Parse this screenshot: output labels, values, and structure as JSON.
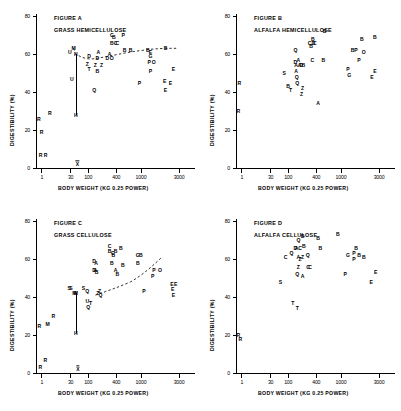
{
  "figure": {
    "layout": "2x2 grid of scatter plots",
    "axis": {
      "ylabel": "DIGESTIBILITY (%)",
      "xlabel": "BODY WEIGHT  (KG 0.25 POWER)",
      "yticks": [
        "0",
        "20",
        "40",
        "60",
        "80"
      ],
      "ytick_values": [
        0,
        20,
        40,
        60,
        80
      ],
      "xticks": [
        "1",
        "30",
        "100",
        "400",
        "1000",
        "3000"
      ],
      "xtick_values": [
        1,
        30,
        100,
        400,
        1000,
        3000
      ],
      "ylim": [
        0,
        80
      ],
      "grid": false,
      "legend": "none"
    }
  },
  "chart_data": [
    {
      "type": "scatter",
      "id": "A",
      "title": "FIGURE A",
      "subtitle": "GRASS HEMICELLULOSE",
      "xlabel": "BODY WEIGHT  (KG 0.25 POWER)",
      "ylabel": "DIGESTIBILITY (%)",
      "ylim": [
        0,
        80
      ],
      "xticks": [
        1,
        30,
        100,
        400,
        1000,
        3000
      ],
      "yticks": [
        0,
        20,
        40,
        60,
        80
      ],
      "grid": false,
      "point_labels": "single-letter species codes",
      "points": [
        {
          "label": "R",
          "x": 0.55,
          "y": 26
        },
        {
          "label": "R",
          "x": 0.95,
          "y": 19
        },
        {
          "label": "R",
          "x": 0.8,
          "y": 7
        },
        {
          "label": "R",
          "x": 1.9,
          "y": 7
        },
        {
          "label": "R",
          "x": 3.6,
          "y": 29
        },
        {
          "label": "U",
          "x": 28,
          "y": 61
        },
        {
          "label": "U",
          "x": 33,
          "y": 47
        },
        {
          "label": "M",
          "x": 38,
          "y": 63
        },
        {
          "label": "H",
          "x": 45,
          "y": 60
        },
        {
          "label": "H",
          "x": 45,
          "y": 28
        },
        {
          "label": "D",
          "x": 105,
          "y": 59
        },
        {
          "label": "Z",
          "x": 95,
          "y": 55
        },
        {
          "label": "T",
          "x": 105,
          "y": 52
        },
        {
          "label": "Q",
          "x": 140,
          "y": 41
        },
        {
          "label": "A",
          "x": 175,
          "y": 61
        },
        {
          "label": "D",
          "x": 165,
          "y": 58
        },
        {
          "label": "Z",
          "x": 150,
          "y": 54
        },
        {
          "label": "B",
          "x": 165,
          "y": 51
        },
        {
          "label": "Z",
          "x": 205,
          "y": 54
        },
        {
          "label": "C",
          "x": 330,
          "y": 70
        },
        {
          "label": "B",
          "x": 360,
          "y": 69
        },
        {
          "label": "B",
          "x": 330,
          "y": 66
        },
        {
          "label": "C",
          "x": 390,
          "y": 66
        },
        {
          "label": "C",
          "x": 420,
          "y": 66
        },
        {
          "label": "P",
          "x": 530,
          "y": 70
        },
        {
          "label": "A",
          "x": 300,
          "y": 60
        },
        {
          "label": "D",
          "x": 270,
          "y": 58
        },
        {
          "label": "O",
          "x": 330,
          "y": 58
        },
        {
          "label": "B",
          "x": 560,
          "y": 62
        },
        {
          "label": "B",
          "x": 700,
          "y": 62
        },
        {
          "label": "B",
          "x": 1250,
          "y": 62
        },
        {
          "label": "E",
          "x": 1350,
          "y": 61
        },
        {
          "label": "G",
          "x": 1350,
          "y": 59
        },
        {
          "label": "B",
          "x": 2100,
          "y": 63
        },
        {
          "label": "P",
          "x": 1300,
          "y": 56
        },
        {
          "label": "O",
          "x": 1500,
          "y": 56
        },
        {
          "label": "P",
          "x": 1350,
          "y": 51
        },
        {
          "label": "P",
          "x": 950,
          "y": 45
        },
        {
          "label": "E",
          "x": 2600,
          "y": 52
        },
        {
          "label": "E",
          "x": 2050,
          "y": 46
        },
        {
          "label": "E",
          "x": 2400,
          "y": 45
        },
        {
          "label": "E",
          "x": 2100,
          "y": 41
        }
      ],
      "annotations": [
        {
          "type": "dashed-trend-curve",
          "note": "dashed curve through cluster from ~x=38 rising to right"
        },
        {
          "type": "vertical-line",
          "x": 45,
          "y_from": 28,
          "y_to": 60
        },
        {
          "type": "x-bar-marker",
          "x": 50,
          "y": 0,
          "symbol": "X"
        }
      ]
    },
    {
      "type": "scatter",
      "id": "B",
      "title": "FIGURE B",
      "subtitle": "ALFALFA HEMICELLULOSE",
      "xlabel": "BODY WEIGHT  (KG 0.25 POWER)",
      "ylabel": "DIGESTIBILITY (%)",
      "ylim": [
        0,
        80
      ],
      "xticks": [
        1,
        30,
        100,
        400,
        1000,
        3000
      ],
      "yticks": [
        0,
        20,
        40,
        60,
        80
      ],
      "grid": false,
      "point_labels": "single-letter species codes",
      "points": [
        {
          "label": "R",
          "x": 0.62,
          "y": 45
        },
        {
          "label": "R",
          "x": 0.5,
          "y": 30
        },
        {
          "label": "S",
          "x": 78,
          "y": 50
        },
        {
          "label": "B",
          "x": 100,
          "y": 43
        },
        {
          "label": "T",
          "x": 115,
          "y": 41
        },
        {
          "label": "Q",
          "x": 150,
          "y": 62
        },
        {
          "label": "D",
          "x": 150,
          "y": 56
        },
        {
          "label": "A",
          "x": 175,
          "y": 57
        },
        {
          "label": "A",
          "x": 155,
          "y": 54
        },
        {
          "label": "A",
          "x": 185,
          "y": 54
        },
        {
          "label": "D",
          "x": 200,
          "y": 54
        },
        {
          "label": "B",
          "x": 225,
          "y": 54
        },
        {
          "label": "A",
          "x": 155,
          "y": 51
        },
        {
          "label": "Q",
          "x": 160,
          "y": 48
        },
        {
          "label": "Q",
          "x": 165,
          "y": 45
        },
        {
          "label": "Z",
          "x": 215,
          "y": 42
        },
        {
          "label": "Z",
          "x": 205,
          "y": 39
        },
        {
          "label": "C",
          "x": 300,
          "y": 66
        },
        {
          "label": "B",
          "x": 345,
          "y": 68
        },
        {
          "label": "B",
          "x": 320,
          "y": 64
        },
        {
          "label": "D",
          "x": 355,
          "y": 66
        },
        {
          "label": "C",
          "x": 375,
          "y": 66
        },
        {
          "label": "C",
          "x": 340,
          "y": 57
        },
        {
          "label": "B",
          "x": 560,
          "y": 72
        },
        {
          "label": "B",
          "x": 530,
          "y": 57
        },
        {
          "label": "A",
          "x": 430,
          "y": 34
        },
        {
          "label": "B",
          "x": 1450,
          "y": 62
        },
        {
          "label": "P",
          "x": 1600,
          "y": 62
        },
        {
          "label": "B",
          "x": 1900,
          "y": 68
        },
        {
          "label": "B",
          "x": 2700,
          "y": 69
        },
        {
          "label": "O",
          "x": 2000,
          "y": 61
        },
        {
          "label": "P",
          "x": 1750,
          "y": 57
        },
        {
          "label": "P",
          "x": 1250,
          "y": 52
        },
        {
          "label": "G",
          "x": 1300,
          "y": 49
        },
        {
          "label": "E",
          "x": 2700,
          "y": 51
        },
        {
          "label": "E",
          "x": 2500,
          "y": 48
        }
      ],
      "annotations": []
    },
    {
      "type": "scatter",
      "id": "C",
      "title": "FIGURE C",
      "subtitle": "GRASS CELLULOSE",
      "xlabel": "BODY WEIGHT  (KG 0.25 POWER)",
      "ylabel": "DIGESTIBILITY (%)",
      "ylim": [
        0,
        80
      ],
      "xticks": [
        1,
        30,
        100,
        400,
        1000,
        3000
      ],
      "yticks": [
        0,
        20,
        40,
        60,
        80
      ],
      "grid": false,
      "point_labels": "single-letter species codes",
      "points": [
        {
          "label": "R",
          "x": 0.6,
          "y": 25
        },
        {
          "label": "R",
          "x": 1.8,
          "y": 7
        },
        {
          "label": "R",
          "x": 0.75,
          "y": 3
        },
        {
          "label": "M",
          "x": 2.6,
          "y": 26
        },
        {
          "label": "R",
          "x": 5.5,
          "y": 30
        },
        {
          "label": "S",
          "x": 27,
          "y": 45
        },
        {
          "label": "S",
          "x": 31,
          "y": 45
        },
        {
          "label": "M",
          "x": 40,
          "y": 42
        },
        {
          "label": "M",
          "x": 45,
          "y": 42
        },
        {
          "label": "H",
          "x": 45,
          "y": 21
        },
        {
          "label": "S",
          "x": 75,
          "y": 45
        },
        {
          "label": "Q",
          "x": 95,
          "y": 43
        },
        {
          "label": "U",
          "x": 95,
          "y": 38
        },
        {
          "label": "Q",
          "x": 100,
          "y": 35
        },
        {
          "label": "T",
          "x": 115,
          "y": 37
        },
        {
          "label": "D",
          "x": 140,
          "y": 59
        },
        {
          "label": "A",
          "x": 155,
          "y": 58
        },
        {
          "label": "D",
          "x": 140,
          "y": 54
        },
        {
          "label": "A",
          "x": 150,
          "y": 54
        },
        {
          "label": "B",
          "x": 160,
          "y": 53
        },
        {
          "label": "Z",
          "x": 170,
          "y": 42
        },
        {
          "label": "Z",
          "x": 185,
          "y": 43
        },
        {
          "label": "Q",
          "x": 195,
          "y": 41
        },
        {
          "label": "C",
          "x": 300,
          "y": 67
        },
        {
          "label": "B",
          "x": 300,
          "y": 64
        },
        {
          "label": "B",
          "x": 355,
          "y": 62
        },
        {
          "label": "C",
          "x": 345,
          "y": 63
        },
        {
          "label": "B",
          "x": 390,
          "y": 64
        },
        {
          "label": "B",
          "x": 330,
          "y": 58
        },
        {
          "label": "B",
          "x": 480,
          "y": 66
        },
        {
          "label": "A",
          "x": 390,
          "y": 54
        },
        {
          "label": "B",
          "x": 420,
          "y": 52
        },
        {
          "label": "B",
          "x": 520,
          "y": 57
        },
        {
          "label": "G",
          "x": 900,
          "y": 62
        },
        {
          "label": "B",
          "x": 1000,
          "y": 62
        },
        {
          "label": "B",
          "x": 900,
          "y": 58
        },
        {
          "label": "P",
          "x": 1500,
          "y": 54
        },
        {
          "label": "O",
          "x": 1800,
          "y": 54
        },
        {
          "label": "P",
          "x": 1450,
          "y": 51
        },
        {
          "label": "P",
          "x": 1100,
          "y": 43
        },
        {
          "label": "E",
          "x": 2500,
          "y": 47
        },
        {
          "label": "E",
          "x": 2750,
          "y": 47
        },
        {
          "label": "E",
          "x": 2550,
          "y": 44
        },
        {
          "label": "E",
          "x": 2600,
          "y": 41
        }
      ],
      "annotations": [
        {
          "type": "dashed-trend-curve",
          "note": "dashed curve rising from ~x=170 toward right edge"
        },
        {
          "type": "vertical-line",
          "x": 45,
          "y_from": 21,
          "y_to": 42
        },
        {
          "type": "x-bar-marker",
          "x": 52,
          "y": 0,
          "symbol": "X"
        }
      ]
    },
    {
      "type": "scatter",
      "id": "D",
      "title": "FIGURE D",
      "subtitle": "ALFALFA CELLULOSE",
      "xlabel": "BODY WEIGHT  (KG 0.25 POWER)",
      "ylabel": "DIGESTIBILITY (%)",
      "ylim": [
        0,
        80
      ],
      "xticks": [
        1,
        30,
        100,
        400,
        1000,
        3000
      ],
      "yticks": [
        0,
        20,
        40,
        60,
        80
      ],
      "grid": false,
      "point_labels": "single-letter species codes",
      "points": [
        {
          "label": "R",
          "x": 0.5,
          "y": 20
        },
        {
          "label": "R",
          "x": 0.75,
          "y": 18
        },
        {
          "label": "S",
          "x": 62,
          "y": 48
        },
        {
          "label": "C",
          "x": 85,
          "y": 61
        },
        {
          "label": "Q",
          "x": 120,
          "y": 63
        },
        {
          "label": "Q",
          "x": 175,
          "y": 70
        },
        {
          "label": "B",
          "x": 215,
          "y": 72
        },
        {
          "label": "D",
          "x": 150,
          "y": 66
        },
        {
          "label": "A",
          "x": 160,
          "y": 66
        },
        {
          "label": "C",
          "x": 190,
          "y": 66
        },
        {
          "label": "B",
          "x": 230,
          "y": 67
        },
        {
          "label": "A",
          "x": 175,
          "y": 61
        },
        {
          "label": "Z",
          "x": 190,
          "y": 60
        },
        {
          "label": "Z",
          "x": 215,
          "y": 61
        },
        {
          "label": "Q",
          "x": 275,
          "y": 62
        },
        {
          "label": "Z",
          "x": 175,
          "y": 56
        },
        {
          "label": "Q",
          "x": 165,
          "y": 52
        },
        {
          "label": "A",
          "x": 215,
          "y": 51
        },
        {
          "label": "C",
          "x": 280,
          "y": 56
        },
        {
          "label": "C",
          "x": 305,
          "y": 56
        },
        {
          "label": "B",
          "x": 430,
          "y": 71
        },
        {
          "label": "B",
          "x": 470,
          "y": 66
        },
        {
          "label": "B",
          "x": 900,
          "y": 73
        },
        {
          "label": "G",
          "x": 1250,
          "y": 62
        },
        {
          "label": "B",
          "x": 1600,
          "y": 66
        },
        {
          "label": "P",
          "x": 1500,
          "y": 63
        },
        {
          "label": "P",
          "x": 1500,
          "y": 60
        },
        {
          "label": "B",
          "x": 1750,
          "y": 62
        },
        {
          "label": "B",
          "x": 2000,
          "y": 61
        },
        {
          "label": "P",
          "x": 1150,
          "y": 52
        },
        {
          "label": "E",
          "x": 2750,
          "y": 53
        },
        {
          "label": "E",
          "x": 2450,
          "y": 48
        },
        {
          "label": "T",
          "x": 130,
          "y": 37
        },
        {
          "label": "T",
          "x": 165,
          "y": 34
        }
      ],
      "annotations": []
    }
  ]
}
